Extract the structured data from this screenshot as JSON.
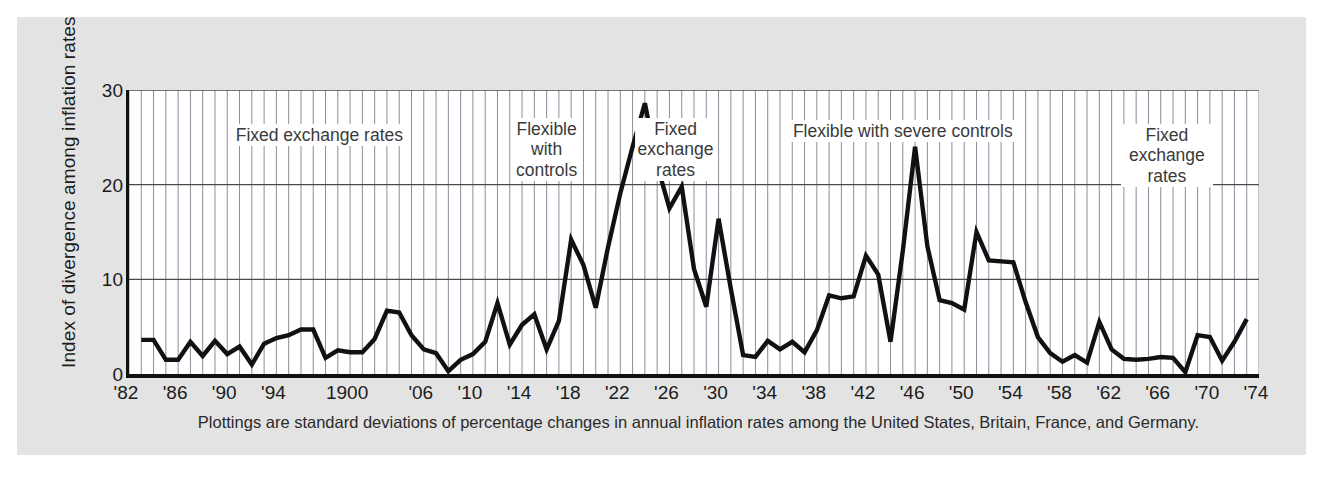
{
  "figure": {
    "background_color": "#e3e3e3",
    "plot_background_color": "#ffffff",
    "line_color": "#111111",
    "grid_color": "#8d8d9a"
  },
  "caption": "Plottings are standard deviations of percentage changes in annual inflation rates among the United States, Britain, France, and Germany.",
  "chart_data": {
    "type": "line",
    "title": "",
    "xlabel": "",
    "ylabel": "Index of divergence among inflation rates",
    "xlim": [
      1882,
      1974
    ],
    "ylim": [
      0,
      30
    ],
    "yticks": [
      0,
      10,
      20,
      30
    ],
    "ytick_labels": [
      "0",
      "10",
      "20",
      "30"
    ],
    "xtick_values": [
      1882,
      1886,
      1890,
      1894,
      1900,
      1906,
      1910,
      1914,
      1918,
      1922,
      1926,
      1930,
      1934,
      1938,
      1942,
      1946,
      1950,
      1954,
      1958,
      1962,
      1966,
      1970,
      1974
    ],
    "xtick_labels": [
      "'82",
      "'86",
      "'90",
      "'94",
      "1900",
      "'06",
      "'10",
      "'14",
      "'18",
      "'22",
      "'26",
      "'30",
      "'34",
      "'38",
      "'42",
      "'46",
      "'50",
      "'54",
      "'58",
      "'62",
      "'66",
      "'70",
      "'74"
    ],
    "grid": "vertical minor lines each year; horizontal lines at 10, 20, 30",
    "legend": "none",
    "x": [
      1883,
      1884,
      1885,
      1886,
      1887,
      1888,
      1889,
      1890,
      1891,
      1892,
      1893,
      1894,
      1895,
      1896,
      1897,
      1898,
      1899,
      1900,
      1901,
      1902,
      1903,
      1904,
      1905,
      1906,
      1907,
      1908,
      1909,
      1910,
      1911,
      1912,
      1913,
      1914,
      1915,
      1916,
      1917,
      1918,
      1919,
      1920,
      1921,
      1922,
      1923,
      1924,
      1925,
      1926,
      1927,
      1928,
      1929,
      1930,
      1931,
      1932,
      1933,
      1934,
      1935,
      1936,
      1937,
      1938,
      1939,
      1940,
      1941,
      1942,
      1943,
      1944,
      1945,
      1946,
      1947,
      1948,
      1949,
      1950,
      1951,
      1952,
      1953,
      1954,
      1955,
      1956,
      1957,
      1958,
      1959,
      1960,
      1961,
      1962,
      1963,
      1964,
      1965,
      1966,
      1967,
      1968,
      1969,
      1970,
      1971,
      1972,
      1973
    ],
    "values": [
      3.6,
      3.6,
      1.5,
      1.5,
      3.4,
      1.9,
      3.5,
      2.1,
      2.9,
      1.0,
      3.2,
      3.8,
      4.1,
      4.7,
      4.7,
      1.7,
      2.5,
      2.3,
      2.3,
      3.7,
      6.7,
      6.5,
      4.1,
      2.6,
      2.2,
      0.3,
      1.5,
      2.1,
      3.4,
      7.5,
      3.1,
      5.2,
      6.3,
      2.6,
      5.6,
      14.2,
      11.5,
      7.0,
      13.4,
      19.1,
      24.0,
      28.6,
      22.1,
      17.5,
      19.8,
      11.1,
      7.1,
      16.4,
      9.0,
      2.0,
      1.8,
      3.5,
      2.6,
      3.4,
      2.3,
      4.6,
      8.3,
      8.0,
      8.2,
      12.5,
      10.5,
      3.4,
      13.0,
      24.0,
      13.5,
      7.8,
      7.5,
      6.8,
      15.0,
      12.0,
      11.9,
      11.8,
      7.6,
      3.9,
      2.2,
      1.3,
      2.0,
      1.2,
      5.5,
      2.6,
      1.6,
      1.5,
      1.6,
      1.8,
      1.7,
      0.2,
      4.1,
      3.9,
      1.4,
      3.4,
      5.8
    ]
  },
  "annotations": [
    {
      "name": "fixed-exchange-rates-1",
      "text": "Fixed exchange rates",
      "x_start": 1882,
      "x_end": 1913
    },
    {
      "name": "flexible-with-controls",
      "text": "Flexible\nwith\ncontrols",
      "x_start": 1914,
      "x_end": 1918
    },
    {
      "name": "fixed-exchange-rates-2",
      "text": "Fixed\nexchange\nrates",
      "x_start": 1922,
      "x_end": 1931
    },
    {
      "name": "flexible-with-severe-controls",
      "text": "Flexible with severe controls",
      "x_start": 1932,
      "x_end": 1958
    },
    {
      "name": "fixed-exchange-rates-3",
      "text": "Fixed exchange rates",
      "x_start": 1959,
      "x_end": 1974
    }
  ]
}
